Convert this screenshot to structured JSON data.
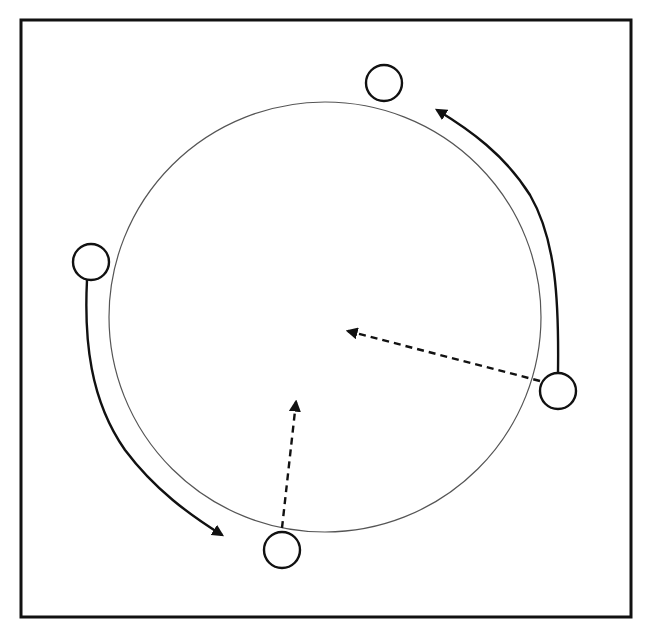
{
  "figure": {
    "type": "diagram",
    "frame": {
      "x": 21,
      "y": 20,
      "width": 610,
      "height": 597,
      "stroke": "#111111"
    },
    "main_circle": {
      "cx": 325,
      "cy": 317,
      "rx": 216,
      "ry": 215,
      "stroke": "#555555"
    },
    "small_circles": [
      {
        "id": "top",
        "cx": 384,
        "cy": 83,
        "r": 18
      },
      {
        "id": "right",
        "cx": 558,
        "cy": 391,
        "r": 18
      },
      {
        "id": "left",
        "cx": 91,
        "cy": 262,
        "r": 18
      },
      {
        "id": "bottom",
        "cx": 282,
        "cy": 550,
        "r": 18
      }
    ],
    "solid_arrows": [
      {
        "id": "right-arc",
        "from": "right circle",
        "to": "top circle",
        "path": "M558 373 C559 300 556 240 530 195 C505 155 470 130 437 110"
      },
      {
        "id": "left-arc",
        "from": "left circle",
        "to": "bottom circle",
        "path": "M87 280 C84 340 90 400 125 450 C155 490 190 515 222 535"
      }
    ],
    "dashed_arrows": [
      {
        "id": "right-dashed",
        "x1": 540,
        "y1": 381,
        "x2": 348,
        "y2": 331
      },
      {
        "id": "bottom-dashed",
        "x1": 282,
        "y1": 528,
        "x2": 296,
        "y2": 402
      }
    ],
    "caption": {
      "visible": "clipped",
      "text": ""
    }
  }
}
